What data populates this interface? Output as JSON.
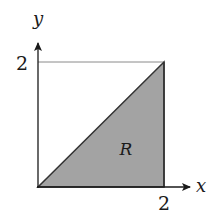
{
  "diagram": {
    "axes": {
      "x_label": "x",
      "y_label": "y",
      "x_tick_label": "2",
      "y_tick_label": "2"
    },
    "region": {
      "label": "R",
      "fill_color": "#a3a3a3",
      "vertices": [
        [
          0,
          0
        ],
        [
          2,
          0
        ],
        [
          2,
          2
        ]
      ]
    },
    "square": {
      "corners": [
        [
          0,
          0
        ],
        [
          2,
          0
        ],
        [
          2,
          2
        ],
        [
          0,
          2
        ]
      ],
      "stroke_color": "#7a7a7a"
    },
    "colors": {
      "axis": "#1a1a1a",
      "region_fill": "#a3a3a3",
      "region_edge": "#333333",
      "box_line": "#8a8a8a"
    }
  }
}
